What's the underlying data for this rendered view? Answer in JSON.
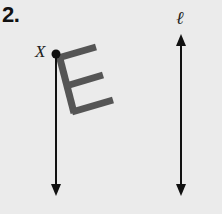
{
  "problem": {
    "number": "2.",
    "point_label": "X",
    "line_label": "ℓ",
    "figure_letter": "E"
  },
  "colors": {
    "background": "#ebebeb",
    "lines": "#111111",
    "figure": "#555555"
  }
}
